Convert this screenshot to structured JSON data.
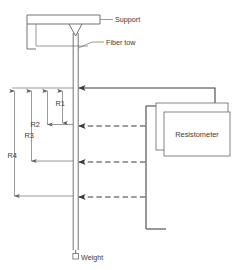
{
  "figure": {
    "labels": {
      "support": "Support",
      "fiber_tow": "Fiber tow",
      "weight": "Weight",
      "resistometer": "Resistometer"
    },
    "dimensions": [
      {
        "id": "R1",
        "label": "R1"
      },
      {
        "id": "R2",
        "label": "R2"
      },
      {
        "id": "R3",
        "label": "R3"
      },
      {
        "id": "R4",
        "label": "R4"
      }
    ],
    "colors": {
      "line": "#5a5a5a",
      "wire": "#3c3c3c",
      "text": "#3a3a3a",
      "background": "#ffffff"
    },
    "probe_connections": [
      {
        "index": 1,
        "style": "solid",
        "y": 88
      },
      {
        "index": 2,
        "style": "dashed",
        "y": 126
      },
      {
        "index": 3,
        "style": "dashed",
        "y": 162
      },
      {
        "index": 4,
        "style": "dashed",
        "y": 197
      }
    ]
  }
}
